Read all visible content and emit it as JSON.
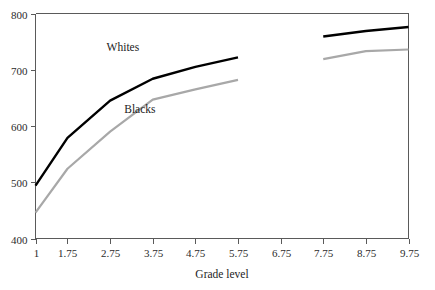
{
  "chart_data": {
    "type": "line",
    "title": "",
    "xlabel": "Grade level",
    "ylabel": "",
    "xlim": [
      1,
      9.75
    ],
    "ylim": [
      400,
      800
    ],
    "grid": false,
    "legend_position": "inline-annotation",
    "x_ticks": [
      "1",
      "1.75",
      "2.75",
      "3.75",
      "4.75",
      "5.75",
      "6.75",
      "7.75",
      "8.75",
      "9.75"
    ],
    "x_tick_values": [
      1,
      1.75,
      2.75,
      3.75,
      4.75,
      5.75,
      6.75,
      7.75,
      8.75,
      9.75
    ],
    "y_ticks": [
      "400",
      "500",
      "600",
      "700",
      "800"
    ],
    "y_tick_values": [
      400,
      500,
      600,
      700,
      800
    ],
    "series": [
      {
        "name": "Whites",
        "color": "#000000",
        "x": [
          1,
          1.75,
          2.75,
          3.75,
          4.75,
          5.75,
          7.75,
          8.75,
          9.75
        ],
        "values": [
          494,
          579,
          645,
          684,
          705,
          722,
          759,
          769,
          776
        ]
      },
      {
        "name": "Blacks",
        "color": "#a8a8a8",
        "x": [
          1,
          1.75,
          2.75,
          3.75,
          4.75,
          5.75,
          7.75,
          8.75,
          9.75
        ],
        "values": [
          446,
          524,
          590,
          647,
          665,
          682,
          719,
          733,
          736
        ]
      }
    ],
    "annotations": [
      {
        "text": "Whites",
        "x": 3.05,
        "y": 733
      },
      {
        "text": "Blacks",
        "x": 3.45,
        "y": 623
      }
    ]
  },
  "axis": {
    "x_title": "Grade level"
  },
  "colors": {
    "whites_line": "#000000",
    "blacks_line": "#a8a8a8",
    "axis": "#5a5a5a",
    "text": "#1c1c1c",
    "background": "#ffffff"
  }
}
